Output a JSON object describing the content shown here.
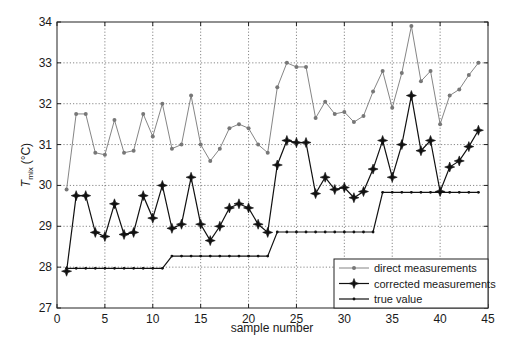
{
  "chart_data": {
    "type": "line",
    "title": "",
    "xlabel": "sample number",
    "ylabel_main": "T",
    "ylabel_sub": "mix",
    "ylabel_unit": "(°C)",
    "xlim": [
      0,
      45
    ],
    "ylim": [
      27,
      34
    ],
    "xticks": [
      0,
      5,
      10,
      15,
      20,
      25,
      30,
      35,
      40,
      45
    ],
    "yticks": [
      27,
      28,
      29,
      30,
      31,
      32,
      33,
      34
    ],
    "grid": true,
    "legend_position": "lower right",
    "x": [
      1,
      2,
      3,
      4,
      5,
      6,
      7,
      8,
      9,
      10,
      11,
      12,
      13,
      14,
      15,
      16,
      17,
      18,
      19,
      20,
      21,
      22,
      23,
      24,
      25,
      26,
      27,
      28,
      29,
      30,
      31,
      32,
      33,
      34,
      35,
      36,
      37,
      38,
      39,
      40,
      41,
      42,
      43,
      44
    ],
    "series": [
      {
        "name": "direct measurements",
        "marker": "dot",
        "color": "#777777",
        "values": [
          29.9,
          31.75,
          31.75,
          30.8,
          30.75,
          31.6,
          30.8,
          30.85,
          31.75,
          31.2,
          32.0,
          30.9,
          31.0,
          32.2,
          31.0,
          30.6,
          30.9,
          31.4,
          31.5,
          31.4,
          31.0,
          30.8,
          32.4,
          33.0,
          32.9,
          32.9,
          31.65,
          32.05,
          31.75,
          31.8,
          31.55,
          31.7,
          32.3,
          32.8,
          31.9,
          32.75,
          33.9,
          32.55,
          32.8,
          31.5,
          32.2,
          32.35,
          32.7,
          33.0
        ]
      },
      {
        "name": "corrected measurements",
        "marker": "star",
        "color": "#111111",
        "values": [
          27.9,
          29.75,
          29.75,
          28.85,
          28.75,
          29.55,
          28.8,
          28.85,
          29.75,
          29.2,
          30.0,
          28.95,
          29.05,
          30.2,
          29.05,
          28.65,
          29.0,
          29.45,
          29.55,
          29.45,
          29.05,
          28.85,
          30.5,
          31.1,
          31.05,
          31.05,
          29.8,
          30.2,
          29.9,
          29.95,
          29.7,
          29.85,
          30.4,
          31.1,
          30.2,
          31.0,
          32.2,
          30.85,
          31.1,
          29.85,
          30.45,
          30.6,
          30.95,
          31.35
        ]
      },
      {
        "name": "true value",
        "marker": "small-dot",
        "color": "#111111",
        "values": [
          27.97,
          27.97,
          27.97,
          27.97,
          27.97,
          27.97,
          27.97,
          27.97,
          27.97,
          27.97,
          27.97,
          28.27,
          28.27,
          28.27,
          28.27,
          28.27,
          28.27,
          28.27,
          28.27,
          28.27,
          28.27,
          28.27,
          28.86,
          28.86,
          28.86,
          28.86,
          28.86,
          28.86,
          28.86,
          28.86,
          28.86,
          28.86,
          28.86,
          29.83,
          29.83,
          29.83,
          29.83,
          29.83,
          29.83,
          29.83,
          29.83,
          29.83,
          29.83,
          29.83
        ]
      }
    ]
  },
  "colors": {
    "axis": "#222222",
    "grid": "#555555",
    "background": "#ffffff"
  }
}
